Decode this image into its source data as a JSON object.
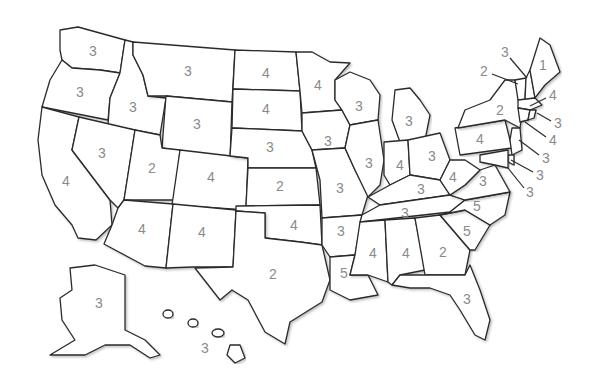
{
  "map": {
    "title": "United States",
    "label_color": "#8a8a8a",
    "stroke_color": "#2b2b2b",
    "states": [
      {
        "id": "WA",
        "name": "Washington",
        "value": "3",
        "x": 93,
        "y": 52
      },
      {
        "id": "OR",
        "name": "Oregon",
        "value": "3",
        "x": 80,
        "y": 93
      },
      {
        "id": "CA",
        "name": "California",
        "value": "4",
        "x": 66,
        "y": 182
      },
      {
        "id": "ID",
        "name": "Idaho",
        "value": "3",
        "x": 133,
        "y": 108
      },
      {
        "id": "NV",
        "name": "Nevada",
        "value": "3",
        "x": 102,
        "y": 154
      },
      {
        "id": "MT",
        "name": "Montana",
        "value": "3",
        "x": 188,
        "y": 72
      },
      {
        "id": "WY",
        "name": "Wyoming",
        "value": "3",
        "x": 197,
        "y": 125
      },
      {
        "id": "UT",
        "name": "Utah",
        "value": "2",
        "x": 152,
        "y": 169
      },
      {
        "id": "CO",
        "name": "Colorado",
        "value": "4",
        "x": 211,
        "y": 178
      },
      {
        "id": "AZ",
        "name": "Arizona",
        "value": "4",
        "x": 142,
        "y": 230
      },
      {
        "id": "NM",
        "name": "New Mexico",
        "value": "4",
        "x": 202,
        "y": 233
      },
      {
        "id": "ND",
        "name": "North Dakota",
        "value": "4",
        "x": 266,
        "y": 74
      },
      {
        "id": "SD",
        "name": "South Dakota",
        "value": "4",
        "x": 266,
        "y": 110
      },
      {
        "id": "NE",
        "name": "Nebraska",
        "value": "3",
        "x": 270,
        "y": 148
      },
      {
        "id": "KS",
        "name": "Kansas",
        "value": "2",
        "x": 280,
        "y": 187
      },
      {
        "id": "OK",
        "name": "Oklahoma",
        "value": "4",
        "x": 294,
        "y": 226
      },
      {
        "id": "TX",
        "name": "Texas",
        "value": "2",
        "x": 273,
        "y": 275
      },
      {
        "id": "MN",
        "name": "Minnesota",
        "value": "4",
        "x": 318,
        "y": 86
      },
      {
        "id": "IA",
        "name": "Iowa",
        "value": "3",
        "x": 328,
        "y": 142
      },
      {
        "id": "MO",
        "name": "Missouri",
        "value": "3",
        "x": 340,
        "y": 189
      },
      {
        "id": "AR",
        "name": "Arkansas",
        "value": "3",
        "x": 341,
        "y": 232
      },
      {
        "id": "LA",
        "name": "Louisiana",
        "value": "5",
        "x": 344,
        "y": 274
      },
      {
        "id": "WI",
        "name": "Wisconsin",
        "value": "3",
        "x": 359,
        "y": 107
      },
      {
        "id": "IL",
        "name": "Illinois",
        "value": "3",
        "x": 369,
        "y": 164
      },
      {
        "id": "MI",
        "name": "Michigan",
        "value": "3",
        "x": 409,
        "y": 122
      },
      {
        "id": "IN",
        "name": "Indiana",
        "value": "4",
        "x": 400,
        "y": 166
      },
      {
        "id": "OH",
        "name": "Ohio",
        "value": "3",
        "x": 432,
        "y": 157
      },
      {
        "id": "KY",
        "name": "Kentucky",
        "value": "3",
        "x": 421,
        "y": 190
      },
      {
        "id": "TN",
        "name": "Tennessee",
        "value": "3",
        "x": 405,
        "y": 214
      },
      {
        "id": "MS",
        "name": "Mississippi",
        "value": "4",
        "x": 373,
        "y": 254
      },
      {
        "id": "AL",
        "name": "Alabama",
        "value": "4",
        "x": 406,
        "y": 254
      },
      {
        "id": "GA",
        "name": "Georgia",
        "value": "2",
        "x": 443,
        "y": 253
      },
      {
        "id": "FL",
        "name": "Florida",
        "value": "3",
        "x": 467,
        "y": 300
      },
      {
        "id": "SC",
        "name": "South Carolina",
        "value": "5",
        "x": 467,
        "y": 232
      },
      {
        "id": "NC",
        "name": "North Carolina",
        "value": "5",
        "x": 477,
        "y": 207
      },
      {
        "id": "VA",
        "name": "Virginia",
        "value": "3",
        "x": 483,
        "y": 182
      },
      {
        "id": "WV",
        "name": "West Virginia",
        "value": "4",
        "x": 453,
        "y": 178
      },
      {
        "id": "PA",
        "name": "Pennsylvania",
        "value": "4",
        "x": 480,
        "y": 140
      },
      {
        "id": "NY",
        "name": "New York",
        "value": "2",
        "x": 500,
        "y": 111
      },
      {
        "id": "ME",
        "name": "Maine",
        "value": "1",
        "x": 543,
        "y": 66
      },
      {
        "id": "AK",
        "name": "Alaska",
        "value": "3",
        "x": 99,
        "y": 304
      },
      {
        "id": "HI",
        "name": "Hawaii",
        "value": "3",
        "x": 205,
        "y": 349
      }
    ],
    "callouts": [
      {
        "id": "VT",
        "name": "Vermont",
        "value": "3",
        "x": 505,
        "y": 53,
        "lx1": 510,
        "ly1": 58,
        "lx2": 527,
        "ly2": 78
      },
      {
        "id": "NH",
        "name": "New Hampshire",
        "value": "2",
        "x": 484,
        "y": 72,
        "lx1": 492,
        "ly1": 74,
        "lx2": 518,
        "ly2": 84
      },
      {
        "id": "MA",
        "name": "Massachusetts",
        "value": "4",
        "x": 553,
        "y": 96,
        "lx1": 546,
        "ly1": 98,
        "lx2": 530,
        "ly2": 106
      },
      {
        "id": "RI",
        "name": "Rhode Island",
        "value": "3",
        "x": 558,
        "y": 124,
        "lx1": 551,
        "ly1": 121,
        "lx2": 537,
        "ly2": 113
      },
      {
        "id": "CT",
        "name": "Connecticut",
        "value": "4",
        "x": 553,
        "y": 141,
        "lx1": 546,
        "ly1": 137,
        "lx2": 525,
        "ly2": 122
      },
      {
        "id": "NJ",
        "name": "New Jersey",
        "value": "3",
        "x": 546,
        "y": 159,
        "lx1": 539,
        "ly1": 155,
        "lx2": 519,
        "ly2": 140
      },
      {
        "id": "DE",
        "name": "Delaware",
        "value": "3",
        "x": 540,
        "y": 176,
        "lx1": 533,
        "ly1": 172,
        "lx2": 511,
        "ly2": 160
      },
      {
        "id": "MD",
        "name": "Maryland",
        "value": "3",
        "x": 530,
        "y": 193,
        "lx1": 524,
        "ly1": 188,
        "lx2": 508,
        "ly2": 168
      }
    ]
  }
}
